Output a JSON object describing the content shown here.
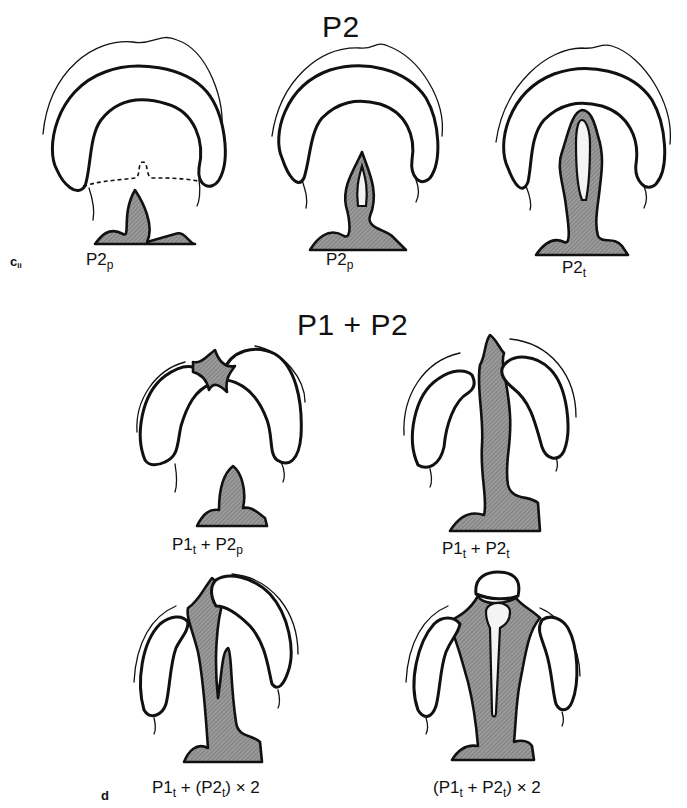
{
  "figure": {
    "panel_c": {
      "letter": "c",
      "letter_sub": "ii",
      "title": "P2",
      "specimens": [
        {
          "id": "c1",
          "label_main": "P2",
          "label_sub": "p",
          "tissue_color": "#8c8c8c"
        },
        {
          "id": "c2",
          "label_main": "P2",
          "label_sub": "p",
          "tissue_color": "#8c8c8c"
        },
        {
          "id": "c3",
          "label_main": "P2",
          "label_sub": "t",
          "tissue_color": "#8c8c8c"
        }
      ]
    },
    "panel_d": {
      "letter": "d",
      "title": "P1 + P2",
      "specimens": [
        {
          "id": "d1",
          "label_parts": [
            "P1",
            "t",
            " + P2",
            "p",
            ""
          ],
          "tissue_color": "#8c8c8c"
        },
        {
          "id": "d2",
          "label_parts": [
            "P1",
            "t",
            " + P2",
            "t",
            ""
          ],
          "tissue_color": "#8c8c8c"
        },
        {
          "id": "d3",
          "label_parts": [
            "P1",
            "t",
            " + (P2",
            "t",
            ") × 2"
          ],
          "tissue_color": "#8c8c8c"
        },
        {
          "id": "d4",
          "label_parts": [
            "(P1",
            "t",
            " + P2",
            "t",
            ") × 2"
          ],
          "tissue_color": "#8c8c8c"
        }
      ]
    }
  }
}
